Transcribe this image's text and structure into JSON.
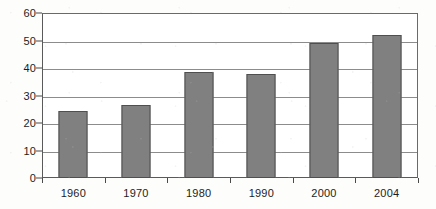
{
  "chart_data": {
    "type": "bar",
    "title": "",
    "subtitle": "",
    "xlabel": "",
    "ylabel": "",
    "categories": [
      "1960",
      "1970",
      "1980",
      "1990",
      "2000",
      "2004"
    ],
    "values": [
      24.5,
      26.5,
      38.5,
      38,
      49,
      52
    ],
    "series": [
      {
        "name": "",
        "values": [
          24.5,
          26.5,
          38.5,
          38,
          49,
          52
        ],
        "color": "#808080"
      }
    ],
    "ylim": [
      0,
      60
    ],
    "ytick_step": 10,
    "yticks": [
      "0",
      "10",
      "20",
      "30",
      "40",
      "50",
      "60"
    ],
    "grid": true,
    "grid_axis": "y",
    "legend": false,
    "legend_position": "none",
    "annotations": [],
    "bar_color": "#808080",
    "bar_border_color": "#4f4f4f",
    "axis_color": "#4a4a4a",
    "gridline_color": "#8c8c8c",
    "background_color": "#ffffff",
    "text_color": "#1c1c1c"
  }
}
